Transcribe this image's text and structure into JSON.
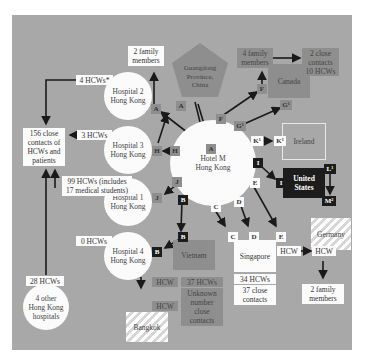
{
  "hub": {
    "label_1": "Hotel M",
    "label_2": "Hong Kong"
  },
  "guangdong": {
    "line1": "Guangdong",
    "line2": "Province,",
    "line3": "China"
  },
  "hospital2": {
    "line1": "Hospital 2",
    "line2": "Hong Kong",
    "family": "2 family members",
    "family1": "2 family",
    "family2": "members",
    "hcw": "4 HCWs*"
  },
  "hospital3": {
    "line1": "Hospital 3",
    "line2": "Hong Kong",
    "hcw": "3 HCWs"
  },
  "hospital1": {
    "line1": "Hospital 1",
    "line2": "Hong Kong",
    "hcw1": "99 HCWs (includes",
    "hcw2": "17 medical students)"
  },
  "hospital4": {
    "line1": "Hospital 4",
    "line2": "Hong Kong",
    "hcw": "0 HCWs"
  },
  "close_contacts": {
    "l1": "156 close",
    "l2": "contacts of",
    "l3": "HCWs and",
    "l4": "patients"
  },
  "other_hospitals": {
    "l1": "4 other",
    "l2": "Hong Kong",
    "l3": "hospitals",
    "hcw": "28 HCWs"
  },
  "canada": {
    "label": "Canada",
    "family1": "4 family",
    "family2": "members",
    "contacts1": "2 close",
    "contacts2": "contacts",
    "contacts3": "10 HCWs"
  },
  "ireland": {
    "label": "Ireland"
  },
  "us": {
    "l1": "United",
    "l2": "States"
  },
  "vietnam": {
    "label": "Vietnam",
    "hcw_count": "37 HCWs",
    "c1": "Unknown",
    "c2": "number",
    "c3": "close",
    "c4": "contacts",
    "hcw_a": "HCW",
    "hcw_b": "HCW"
  },
  "bangkok": {
    "label": "Bangkok"
  },
  "singapore": {
    "label": "Singapore",
    "hcws": "34 HCWs",
    "c1": "37 close",
    "c2": "contacts",
    "hcw": "HCW"
  },
  "germany": {
    "label": "Germany",
    "hcw": "HCW",
    "f1": "2 family",
    "f2": "members"
  },
  "tags": {
    "A": "A",
    "B": "B",
    "C": "C",
    "D": "D",
    "E": "E",
    "F": "F",
    "G": "G¹",
    "H": "H",
    "I": "I",
    "J": "J",
    "K": "K¹",
    "L": "L¹",
    "M": "M²"
  },
  "colors": {
    "background": "#a8a8a8",
    "node": "#fbfbfb",
    "dark_gray": "#8e8e8e",
    "black": "#1c1c1c"
  }
}
